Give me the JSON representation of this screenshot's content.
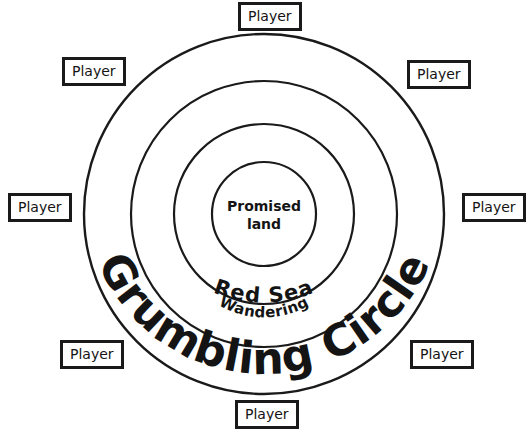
{
  "diagram": {
    "title": "Grumbling Circle",
    "background_color": "#ffffff",
    "line_color": "#1a1a1a",
    "rings": [
      {
        "name": "Grumbling Circle",
        "label": "Grumbling Circle",
        "radius": 180,
        "label_style": "curved-bottom-large"
      },
      {
        "name": "Red Sea",
        "label": "Red Sea",
        "radius": 133,
        "label_style": "curved-bottom-medium"
      },
      {
        "name": "Wandering",
        "label": "Wandering",
        "radius": 90,
        "label_style": "curved-bottom-small"
      },
      {
        "name": "Promised land",
        "label": "Promised land",
        "radius": 52,
        "label_style": "center-two-line"
      }
    ],
    "center": {
      "line1": "Promised",
      "line2": "land"
    },
    "labels": {
      "wandering": "Wandering",
      "red_sea": "Red Sea",
      "grumbling_circle": "Grumbling Circle"
    },
    "players": [
      {
        "label": "Player",
        "position": "top-center",
        "left": 238,
        "top": 2
      },
      {
        "label": "Player",
        "position": "top-left",
        "left": 62,
        "top": 57
      },
      {
        "label": "Player",
        "position": "top-right",
        "left": 407,
        "top": 60
      },
      {
        "label": "Player",
        "position": "mid-left",
        "left": 8,
        "top": 193
      },
      {
        "label": "Player",
        "position": "mid-right",
        "left": 462,
        "top": 193
      },
      {
        "label": "Player",
        "position": "bottom-left",
        "left": 60,
        "top": 340
      },
      {
        "label": "Player",
        "position": "bottom-right",
        "left": 410,
        "top": 340
      },
      {
        "label": "Player",
        "position": "bottom-center",
        "left": 235,
        "top": 400
      }
    ],
    "player_count": 8
  }
}
